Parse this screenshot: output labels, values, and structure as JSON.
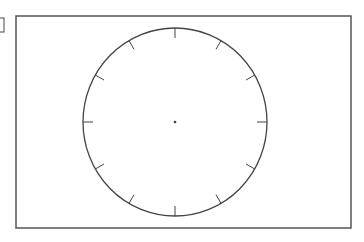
{
  "diagram": {
    "type": "blank clock face",
    "frame": {
      "x": 16,
      "y": 16,
      "width": 335,
      "height": 212,
      "stroke": "#555555"
    },
    "side_marker": {
      "x": -2,
      "y": 18,
      "width": 6,
      "height": 14,
      "stroke": "#666666"
    },
    "clock": {
      "cx": 175,
      "cy": 122,
      "rx": 92,
      "ry": 94,
      "stroke": "#444444",
      "tick_count": 12,
      "tick_length": 10,
      "center_dot_radius": 1.3,
      "hands": []
    }
  }
}
